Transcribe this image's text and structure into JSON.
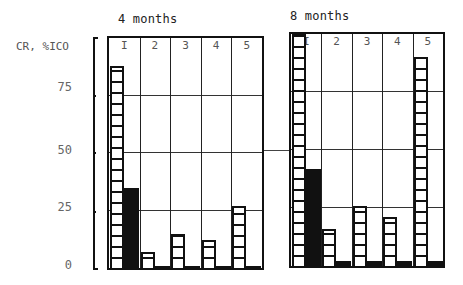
{
  "chart_data": {
    "type": "bar",
    "title": "",
    "ylabel": "CR, %",
    "ylim": [
      0,
      100
    ],
    "yticks": [
      "0",
      "25",
      "50",
      "75",
      "100"
    ],
    "ytick_display_top": "ICO",
    "grid": true,
    "legend": [],
    "panels": [
      {
        "title": "4 months",
        "categories": [
          "I",
          "2",
          "3",
          "4",
          "5"
        ],
        "series": [
          {
            "name": "hatched",
            "style": "hatched",
            "values": [
              88,
              7,
              15,
              12,
              27
            ]
          },
          {
            "name": "solid",
            "style": "solid",
            "values": [
              35,
              1,
              1,
              1,
              1
            ]
          }
        ]
      },
      {
        "title": "8 months",
        "categories": [
          "I",
          "2",
          "3",
          "4",
          "5"
        ],
        "series": [
          {
            "name": "hatched",
            "style": "hatched",
            "values": [
              100,
              16,
              26,
              21,
              90
            ]
          },
          {
            "name": "solid",
            "style": "solid",
            "values": [
              42,
              2,
              2,
              2,
              2
            ]
          }
        ]
      }
    ]
  },
  "labels": {
    "yaxis_title": "CR, %",
    "yaxis_top": "ICO",
    "tick_75": "75",
    "tick_50": "50",
    "tick_25": "25",
    "tick_0": "0",
    "panel1_title": "4 months",
    "panel2_title": "8 months"
  }
}
